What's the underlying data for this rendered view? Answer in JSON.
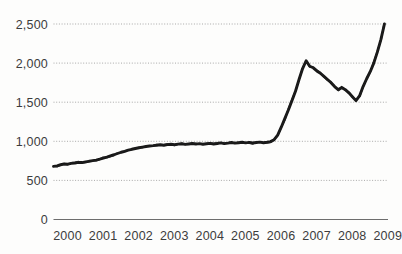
{
  "chart_data": {
    "type": "line",
    "title": "",
    "subtitle": "",
    "xlabel": "",
    "ylabel": "",
    "xlim": [
      2000,
      2009.4
    ],
    "ylim": [
      0,
      2700
    ],
    "grid": true,
    "legend": null,
    "legend_position": "none",
    "line_color": "#161616",
    "grid_color": "#9a9a9a",
    "axis_color": "#6d6d6d",
    "y_ticks": [
      0,
      500,
      1000,
      1500,
      2000,
      2500
    ],
    "y_tick_labels": [
      "0",
      "500",
      "1,000",
      "1,500",
      "2,000",
      "2,500"
    ],
    "x_ticks": [
      2000,
      2001,
      2002,
      2003,
      2004,
      2005,
      2006,
      2007,
      2008,
      2009
    ],
    "x_tick_labels": [
      "2000",
      "2001",
      "2002",
      "2003",
      "2004",
      "2005",
      "2006",
      "2007",
      "2008",
      "2009"
    ],
    "series": [
      {
        "name": "value",
        "x": [
          2000.0,
          2000.1,
          2000.2,
          2000.3,
          2000.4,
          2000.5,
          2000.6,
          2000.7,
          2000.8,
          2000.9,
          2001.0,
          2001.1,
          2001.2,
          2001.3,
          2001.4,
          2001.5,
          2001.6,
          2001.7,
          2001.8,
          2001.9,
          2002.0,
          2002.1,
          2002.2,
          2002.3,
          2002.4,
          2002.5,
          2002.6,
          2002.7,
          2002.8,
          2002.9,
          2003.0,
          2003.1,
          2003.2,
          2003.3,
          2003.4,
          2003.5,
          2003.6,
          2003.7,
          2003.8,
          2003.9,
          2004.0,
          2004.1,
          2004.2,
          2004.3,
          2004.4,
          2004.5,
          2004.6,
          2004.7,
          2004.8,
          2004.9,
          2005.0,
          2005.1,
          2005.2,
          2005.3,
          2005.4,
          2005.5,
          2005.6,
          2005.7,
          2005.8,
          2005.9,
          2006.0,
          2006.1,
          2006.2,
          2006.3,
          2006.4,
          2006.5,
          2006.6,
          2006.7,
          2006.8,
          2006.9,
          2007.0,
          2007.1,
          2007.2,
          2007.3,
          2007.4,
          2007.5,
          2007.6,
          2007.7,
          2007.8,
          2007.9,
          2008.0,
          2008.1,
          2008.2,
          2008.3,
          2008.4,
          2008.5,
          2008.6,
          2008.7,
          2008.8,
          2008.9,
          2009.0,
          2009.1,
          2009.2,
          2009.3
        ],
        "values": [
          680,
          686,
          700,
          712,
          708,
          718,
          722,
          730,
          728,
          736,
          744,
          752,
          760,
          772,
          786,
          798,
          814,
          828,
          844,
          860,
          872,
          886,
          898,
          908,
          918,
          926,
          934,
          940,
          944,
          950,
          956,
          950,
          958,
          962,
          956,
          964,
          968,
          960,
          966,
          972,
          964,
          970,
          962,
          968,
          974,
          966,
          972,
          980,
          970,
          976,
          984,
          976,
          982,
          988,
          980,
          986,
          978,
          984,
          990,
          982,
          988,
          996,
          1020,
          1080,
          1180,
          1290,
          1400,
          1520,
          1640,
          1790,
          1930,
          2030,
          1960,
          1940,
          1900,
          1870,
          1830,
          1790,
          1750,
          1700,
          1660,
          1690,
          1660,
          1620,
          1570,
          1520,
          1580,
          1700,
          1800,
          1890,
          2000,
          2140,
          2300,
          2500
        ]
      }
    ],
    "start_value": 680,
    "end_value": 2500,
    "peak_value": 2030,
    "peak_x": 2007.1,
    "trough_value": 1520,
    "trough_x": 2008.5,
    "plateau_value": 975
  }
}
